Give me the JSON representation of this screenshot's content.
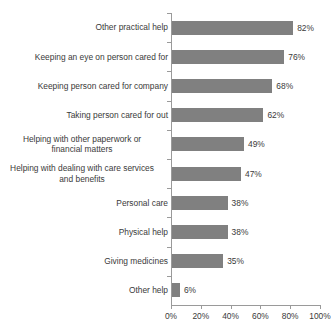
{
  "chart_data": {
    "type": "bar",
    "orientation": "horizontal",
    "title": "",
    "xlabel": "",
    "ylabel": "",
    "xlim": [
      0,
      100
    ],
    "xticks": [
      "0%",
      "20%",
      "40%",
      "60%",
      "80%",
      "100%"
    ],
    "xtick_values": [
      0,
      20,
      40,
      60,
      80,
      100
    ],
    "grid": false,
    "legend": false,
    "bar_color": "#808080",
    "axis_color": "#9a9a9a",
    "background": "#ffffff",
    "categories": [
      "Other practical help",
      "Keeping an eye on person cared for",
      "Keeping person cared for company",
      "Taking person cared for out",
      "Helping with other paperwork or financial matters",
      "Helping with dealing with care services and benefits",
      "Personal care",
      "Physical help",
      "Giving medicines",
      "Other help"
    ],
    "values": [
      82,
      76,
      68,
      62,
      49,
      47,
      38,
      38,
      35,
      6
    ],
    "data_labels": [
      "82%",
      "76%",
      "68%",
      "62%",
      "49%",
      "47%",
      "38%",
      "38%",
      "35%",
      "6%"
    ],
    "bars": [
      {
        "label_lines": [
          "Other practical help"
        ],
        "value": 82,
        "data_label": "82%"
      },
      {
        "label_lines": [
          "Keeping an eye on person cared for"
        ],
        "value": 76,
        "data_label": "76%"
      },
      {
        "label_lines": [
          "Keeping person cared for company"
        ],
        "value": 68,
        "data_label": "68%"
      },
      {
        "label_lines": [
          "Taking person cared for out"
        ],
        "value": 62,
        "data_label": "62%"
      },
      {
        "label_lines": [
          "Helping with other paperwork or",
          "financial matters"
        ],
        "value": 49,
        "data_label": "49%"
      },
      {
        "label_lines": [
          "Helping with dealing with care services",
          "and benefits"
        ],
        "value": 47,
        "data_label": "47%"
      },
      {
        "label_lines": [
          "Personal care"
        ],
        "value": 38,
        "data_label": "38%"
      },
      {
        "label_lines": [
          "Physical help"
        ],
        "value": 38,
        "data_label": "38%"
      },
      {
        "label_lines": [
          "Giving medicines"
        ],
        "value": 35,
        "data_label": "35%"
      },
      {
        "label_lines": [
          "Other help"
        ],
        "value": 6,
        "data_label": "6%"
      }
    ]
  }
}
